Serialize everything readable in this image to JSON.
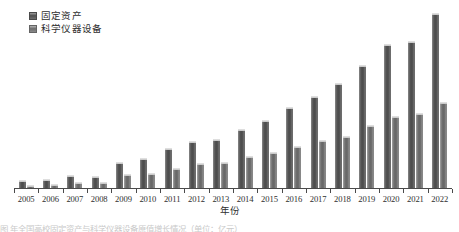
{
  "chart_data": {
    "type": "bar",
    "title": "",
    "xlabel": "年份",
    "ylabel": "",
    "grid": false,
    "legend_position": "top-left",
    "axis": {
      "x_range_labels": [
        "2005",
        "2022"
      ],
      "y_visible_axis": false,
      "ylim": [
        0,
        100
      ]
    },
    "categories": [
      "2005",
      "2006",
      "2007",
      "2008",
      "2009",
      "2010",
      "2011",
      "2012",
      "2013",
      "2014",
      "2015",
      "2016",
      "2017",
      "2018",
      "2019",
      "2020",
      "2021",
      "2022"
    ],
    "series": [
      {
        "name": "固定资产",
        "color": "#4f4f4f",
        "values": [
          4.5,
          4.8,
          7.0,
          6.5,
          14.0,
          16.5,
          21.5,
          25.5,
          26.5,
          32.0,
          37.0,
          44.0,
          50.0,
          57.0,
          67.0,
          78.0,
          80.0,
          95.0
        ]
      },
      {
        "name": "科学仪器设备",
        "color": "#6d6d6d",
        "values": [
          1.8,
          2.2,
          3.0,
          3.2,
          7.5,
          8.0,
          11.0,
          13.5,
          14.0,
          17.5,
          19.5,
          23.0,
          26.0,
          28.5,
          34.0,
          39.0,
          40.5,
          47.0
        ]
      }
    ]
  },
  "legend": {
    "items": [
      {
        "label": "固定资产",
        "swatch": "series-0-swatch"
      },
      {
        "label": "科学仪器设备",
        "swatch": "series-1-swatch"
      }
    ]
  },
  "xaxis": {
    "title": "年份",
    "ticklabels": [
      "2005",
      "2006",
      "2007",
      "2008",
      "2009",
      "2010",
      "2011",
      "2012",
      "2013",
      "2014",
      "2015",
      "2016",
      "2017",
      "2018",
      "2019",
      "2020",
      "2021",
      "2022"
    ]
  },
  "caption": {
    "text": "图                                 年全国高校固定资产与科学仪器设备原值增长情况（单位：亿元）"
  }
}
